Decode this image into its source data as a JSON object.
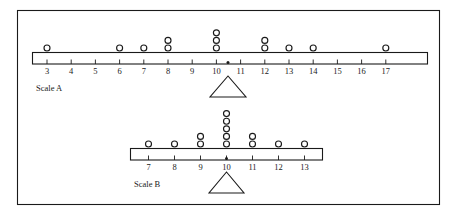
{
  "figure": {
    "background_color": "#ffffff",
    "line_color": "#1a1a1a"
  },
  "chart_data": [
    {
      "type": "scatter",
      "name": "Scale A",
      "title": "Scale A",
      "plot_style": "dot plot on balance scale",
      "xlabel": "",
      "ylabel": "",
      "xlim": [
        2.4,
        17.6
      ],
      "grid": false,
      "axis_ticks": [
        3,
        4,
        5,
        6,
        7,
        8,
        9,
        10,
        11,
        12,
        13,
        14,
        15,
        16,
        17
      ],
      "tick_labels": [
        "3",
        "4",
        "5",
        "6",
        "7",
        "8",
        "9",
        "10",
        "11",
        "12",
        "13",
        "14",
        "15",
        "16",
        "17"
      ],
      "categories": [
        3,
        4,
        5,
        6,
        7,
        8,
        9,
        10,
        11,
        12,
        13,
        14,
        15,
        16,
        17
      ],
      "values": [
        1,
        0,
        0,
        1,
        1,
        2,
        0,
        3,
        0,
        2,
        1,
        1,
        0,
        0,
        1
      ],
      "total_dots": 13,
      "fulcrum_at": 10,
      "label": "Scale A"
    },
    {
      "type": "scatter",
      "name": "Scale B",
      "title": "Scale B",
      "plot_style": "dot plot on balance scale",
      "xlabel": "",
      "ylabel": "",
      "xlim": [
        6.4,
        13.6
      ],
      "grid": false,
      "axis_ticks": [
        7,
        8,
        9,
        10,
        11,
        12,
        13
      ],
      "tick_labels": [
        "7",
        "8",
        "9",
        "10",
        "11",
        "12",
        "13"
      ],
      "categories": [
        7,
        8,
        9,
        10,
        11,
        12,
        13
      ],
      "values": [
        1,
        1,
        2,
        5,
        2,
        1,
        1
      ],
      "total_dots": 13,
      "fulcrum_at": 10,
      "label": "Scale B"
    }
  ]
}
